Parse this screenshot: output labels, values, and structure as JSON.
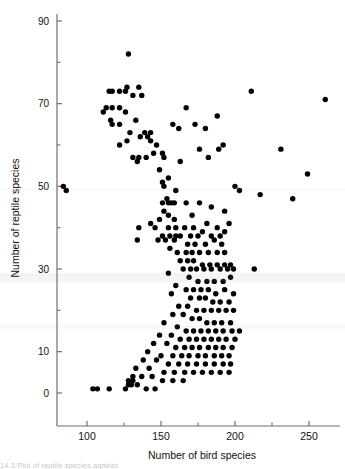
{
  "figure": {
    "caption_partial": "14.3  Plot of reptile species against"
  },
  "chart_data": {
    "type": "scatter",
    "title": "",
    "xlabel": "Number of bird species",
    "ylabel": "Number of reptile species",
    "xlim": [
      75,
      265
    ],
    "ylim": [
      0,
      92
    ],
    "xticks": [
      100,
      150,
      200,
      250
    ],
    "xticklabels": [
      "100",
      "150",
      "200",
      "250"
    ],
    "xminorticks": [
      125,
      175,
      225
    ],
    "yticks": [
      0,
      10,
      30,
      50,
      70,
      90
    ],
    "yticklabels": [
      "0",
      "10",
      "30",
      "50",
      "70",
      "90"
    ],
    "yminorticks": [
      20,
      40,
      60,
      80
    ],
    "grid": false,
    "legend": false,
    "marker": "filled-circle",
    "marker_color": "#000000",
    "marker_size_px": 3.6,
    "axis_color": "#6f6f6f",
    "n_points": 223,
    "points": [
      [
        84,
        50
      ],
      [
        86,
        49
      ],
      [
        128,
        82
      ],
      [
        127,
        74
      ],
      [
        115,
        73
      ],
      [
        117,
        73
      ],
      [
        122,
        73
      ],
      [
        126,
        73
      ],
      [
        135,
        74
      ],
      [
        131,
        72
      ],
      [
        137,
        72
      ],
      [
        211,
        73
      ],
      [
        261,
        71
      ],
      [
        113,
        69
      ],
      [
        117,
        69
      ],
      [
        122,
        69
      ],
      [
        111,
        68
      ],
      [
        126,
        68
      ],
      [
        116,
        66
      ],
      [
        117,
        65
      ],
      [
        122,
        65
      ],
      [
        133,
        66
      ],
      [
        167,
        69
      ],
      [
        188,
        67
      ],
      [
        129,
        63
      ],
      [
        139,
        63
      ],
      [
        143,
        63
      ],
      [
        158,
        65
      ],
      [
        162,
        64
      ],
      [
        173,
        65
      ],
      [
        180,
        64
      ],
      [
        141,
        62
      ],
      [
        136,
        62
      ],
      [
        143,
        61
      ],
      [
        127,
        61
      ],
      [
        122,
        60
      ],
      [
        147,
        60
      ],
      [
        176,
        59
      ],
      [
        189,
        59
      ],
      [
        192,
        60
      ],
      [
        231,
        59
      ],
      [
        131,
        57
      ],
      [
        135,
        57
      ],
      [
        134,
        56
      ],
      [
        140,
        57
      ],
      [
        145,
        58
      ],
      [
        151,
        58
      ],
      [
        152,
        57
      ],
      [
        163,
        56
      ],
      [
        182,
        57
      ],
      [
        249,
        53
      ],
      [
        149,
        54
      ],
      [
        155,
        52
      ],
      [
        151,
        51
      ],
      [
        152,
        50
      ],
      [
        200,
        50
      ],
      [
        203,
        49
      ],
      [
        160,
        49
      ],
      [
        217,
        48
      ],
      [
        239,
        47
      ],
      [
        154,
        47
      ],
      [
        155,
        46
      ],
      [
        157,
        46
      ],
      [
        151,
        46
      ],
      [
        159,
        46
      ],
      [
        167,
        46
      ],
      [
        176,
        46
      ],
      [
        184,
        45
      ],
      [
        193,
        44
      ],
      [
        152,
        44
      ],
      [
        155,
        43
      ],
      [
        149,
        42
      ],
      [
        159,
        42
      ],
      [
        171,
        43
      ],
      [
        181,
        41
      ],
      [
        143,
        41
      ],
      [
        196,
        41
      ],
      [
        135,
        40
      ],
      [
        146,
        40
      ],
      [
        155,
        40
      ],
      [
        160,
        40
      ],
      [
        166,
        40
      ],
      [
        172,
        40
      ],
      [
        178,
        39
      ],
      [
        188,
        40
      ],
      [
        193,
        39
      ],
      [
        151,
        38
      ],
      [
        156,
        38
      ],
      [
        160,
        38
      ],
      [
        163,
        38
      ],
      [
        170,
        38
      ],
      [
        175,
        38
      ],
      [
        184,
        38
      ],
      [
        190,
        38
      ],
      [
        134,
        37
      ],
      [
        148,
        37
      ],
      [
        153,
        37
      ],
      [
        159,
        37
      ],
      [
        168,
        36
      ],
      [
        173,
        36
      ],
      [
        180,
        36
      ],
      [
        186,
        37
      ],
      [
        191,
        36
      ],
      [
        156,
        35
      ],
      [
        161,
        34
      ],
      [
        167,
        34
      ],
      [
        171,
        34
      ],
      [
        176,
        34
      ],
      [
        182,
        34
      ],
      [
        188,
        34
      ],
      [
        193,
        34
      ],
      [
        163,
        32
      ],
      [
        168,
        32
      ],
      [
        172,
        32
      ],
      [
        178,
        31
      ],
      [
        183,
        31
      ],
      [
        188,
        31
      ],
      [
        193,
        31
      ],
      [
        197,
        31
      ],
      [
        165,
        30
      ],
      [
        170,
        30
      ],
      [
        174,
        30
      ],
      [
        179,
        30
      ],
      [
        184,
        30
      ],
      [
        190,
        30
      ],
      [
        195,
        30
      ],
      [
        199,
        30
      ],
      [
        213,
        30
      ],
      [
        155,
        29
      ],
      [
        169,
        28
      ],
      [
        175,
        27
      ],
      [
        181,
        27
      ],
      [
        186,
        27
      ],
      [
        192,
        27
      ],
      [
        197,
        28
      ],
      [
        160,
        26
      ],
      [
        167,
        25
      ],
      [
        172,
        25
      ],
      [
        177,
        25
      ],
      [
        182,
        25
      ],
      [
        187,
        24
      ],
      [
        193,
        25
      ],
      [
        199,
        24
      ],
      [
        157,
        24
      ],
      [
        170,
        23
      ],
      [
        176,
        23
      ],
      [
        180,
        23
      ],
      [
        185,
        22
      ],
      [
        190,
        22
      ],
      [
        196,
        22
      ],
      [
        162,
        21
      ],
      [
        168,
        21
      ],
      [
        174,
        20
      ],
      [
        179,
        20
      ],
      [
        184,
        20
      ],
      [
        189,
        20
      ],
      [
        194,
        20
      ],
      [
        199,
        20
      ],
      [
        158,
        19
      ],
      [
        165,
        19
      ],
      [
        171,
        18
      ],
      [
        176,
        18
      ],
      [
        181,
        17
      ],
      [
        186,
        17
      ],
      [
        191,
        17
      ],
      [
        197,
        17
      ],
      [
        152,
        17
      ],
      [
        161,
        16
      ],
      [
        167,
        15
      ],
      [
        172,
        15
      ],
      [
        177,
        15
      ],
      [
        182,
        15
      ],
      [
        187,
        15
      ],
      [
        192,
        15
      ],
      [
        198,
        15
      ],
      [
        203,
        15
      ],
      [
        149,
        14
      ],
      [
        157,
        14
      ],
      [
        163,
        13
      ],
      [
        169,
        13
      ],
      [
        174,
        13
      ],
      [
        179,
        13
      ],
      [
        184,
        13
      ],
      [
        189,
        13
      ],
      [
        194,
        13
      ],
      [
        200,
        13
      ],
      [
        145,
        12
      ],
      [
        154,
        12
      ],
      [
        160,
        11
      ],
      [
        166,
        11
      ],
      [
        171,
        11
      ],
      [
        176,
        11
      ],
      [
        182,
        11
      ],
      [
        187,
        11
      ],
      [
        192,
        11
      ],
      [
        198,
        11
      ],
      [
        141,
        10
      ],
      [
        150,
        9
      ],
      [
        158,
        9
      ],
      [
        164,
        9
      ],
      [
        169,
        9
      ],
      [
        175,
        9
      ],
      [
        180,
        9
      ],
      [
        186,
        9
      ],
      [
        191,
        9
      ],
      [
        196,
        9
      ],
      [
        138,
        8
      ],
      [
        147,
        8
      ],
      [
        155,
        7
      ],
      [
        162,
        7
      ],
      [
        168,
        7
      ],
      [
        174,
        7
      ],
      [
        180,
        7
      ],
      [
        186,
        7
      ],
      [
        192,
        7
      ],
      [
        197,
        7
      ],
      [
        133,
        6
      ],
      [
        142,
        6
      ],
      [
        152,
        5
      ],
      [
        159,
        5
      ],
      [
        166,
        5
      ],
      [
        172,
        5
      ],
      [
        178,
        5
      ],
      [
        184,
        5
      ],
      [
        190,
        5
      ],
      [
        196,
        5
      ],
      [
        131,
        4
      ],
      [
        137,
        4
      ],
      [
        144,
        4
      ],
      [
        151,
        3
      ],
      [
        158,
        3
      ],
      [
        165,
        3
      ],
      [
        104,
        1
      ],
      [
        107,
        1
      ],
      [
        115,
        1
      ],
      [
        126,
        1
      ],
      [
        128,
        2
      ],
      [
        130,
        2
      ],
      [
        134,
        2
      ],
      [
        140,
        1
      ],
      [
        146,
        1
      ],
      [
        128,
        3
      ],
      [
        131,
        3
      ]
    ]
  }
}
